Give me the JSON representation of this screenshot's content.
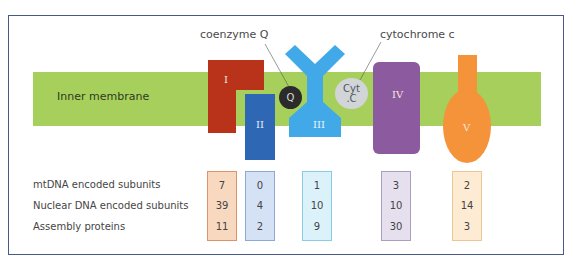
{
  "diagram": {
    "membrane_label": "Inner membrane",
    "callouts": {
      "coenzyme_q": "coenzyme Q",
      "cytochrome_c": "cytochrome c"
    },
    "mobile_carriers": {
      "q": "Q",
      "cyt_c_line1": "Cyt",
      "cyt_c_line2": ".C"
    },
    "complexes": [
      {
        "id": "I",
        "label": "I",
        "color": "#b8331a"
      },
      {
        "id": "II",
        "label": "II",
        "color": "#2e68b5"
      },
      {
        "id": "III",
        "label": "III",
        "color": "#41a9e8"
      },
      {
        "id": "IV",
        "label": "IV",
        "color": "#8c5a9e"
      },
      {
        "id": "V",
        "label": "V",
        "color": "#f4933a"
      }
    ],
    "membrane_color": "#a6d05b"
  },
  "table": {
    "row_labels": [
      "mtDNA encoded subunits",
      "Nuclear DNA encoded subunits",
      "Assembly proteins"
    ],
    "columns": [
      {
        "complex": "I",
        "values": [
          "7",
          "39",
          "11"
        ],
        "bg": "#f8d9c0",
        "border": "#d9946a"
      },
      {
        "complex": "II",
        "values": [
          "0",
          "4",
          "2"
        ],
        "bg": "#d5e2f6",
        "border": "#8aa8d8"
      },
      {
        "complex": "III",
        "values": [
          "1",
          "10",
          "9"
        ],
        "bg": "#dcf2fb",
        "border": "#8ccbe6"
      },
      {
        "complex": "IV",
        "values": [
          "3",
          "10",
          "30"
        ],
        "bg": "#e6e0ee",
        "border": "#aa9fbf"
      },
      {
        "complex": "V",
        "values": [
          "2",
          "14",
          "3"
        ],
        "bg": "#fdebd3",
        "border": "#eec596"
      }
    ]
  }
}
